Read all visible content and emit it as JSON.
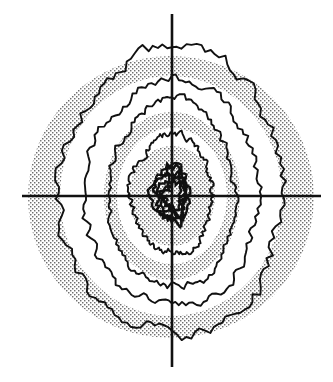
{
  "figure": {
    "type": "contour-map",
    "title": "",
    "canvas": {
      "width": 333,
      "height": 382
    },
    "background_color": "#ffffff",
    "stipple_color": "#7a7a7a",
    "contour_color": "#111111",
    "axis_color": "#111111"
  },
  "axes": {
    "origin": {
      "x": 172,
      "y": 196
    },
    "horizontal": {
      "x1": 22,
      "y1": 196,
      "x2": 321,
      "y2": 196,
      "width": 2.6
    },
    "vertical": {
      "x1": 172,
      "y1": 14,
      "x2": 172,
      "y2": 367,
      "width": 2.6
    }
  },
  "chart_data": {
    "type": "contour",
    "title": "",
    "xlabel": "",
    "ylabel": "",
    "center": {
      "x": 172,
      "y": 196
    },
    "shaded_zones": [
      {
        "name": "outer-field-ellipse",
        "fill": "stipple",
        "level": 1,
        "shape": "ellipse",
        "cx": 171,
        "cy": 197,
        "rx": 143,
        "ry": 141
      },
      {
        "name": "mid-band-ellipse",
        "fill": "stipple",
        "level": 3,
        "shape": "ellipse",
        "cx": 172,
        "cy": 196,
        "rx": 68,
        "ry": 84
      },
      {
        "name": "inner-core-blob",
        "fill": "stipple",
        "level": 5,
        "shape": "ellipse",
        "cx": 172,
        "cy": 196,
        "rx": 43,
        "ry": 50
      }
    ],
    "white_bands": [
      {
        "name": "outer-white-annulus",
        "level": 2,
        "shape": "ellipse",
        "cx": 171,
        "cy": 196,
        "rx": 111,
        "ry": 120
      },
      {
        "name": "inner-white-annulus",
        "level": 4,
        "shape": "ellipse",
        "cx": 172,
        "cy": 196,
        "rx": 55,
        "ry": 68
      }
    ],
    "contours": [
      {
        "name": "contour-1-outermost",
        "level": 1,
        "rx": 112,
        "ry": 140,
        "jag": 7.5
      },
      {
        "name": "contour-2",
        "level": 2,
        "rx": 88,
        "ry": 110,
        "jag": 5.5
      },
      {
        "name": "contour-3",
        "level": 3,
        "rx": 63,
        "ry": 92,
        "jag": 4.5
      },
      {
        "name": "contour-4",
        "level": 4,
        "rx": 41,
        "ry": 58,
        "jag": 4.0
      },
      {
        "name": "contour-5-innermost",
        "level": 5,
        "rx": 14,
        "ry": 26,
        "jag": 5.0
      }
    ],
    "levels": [
      1,
      2,
      3,
      4,
      5
    ],
    "grid": false,
    "legend": null,
    "tick_labels": [],
    "annotations": []
  }
}
